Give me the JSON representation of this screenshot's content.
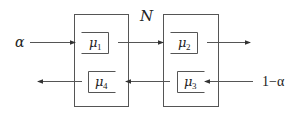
{
  "diagram": {
    "title_label": "N",
    "colors": {
      "stroke": "#555555",
      "text": "#222222",
      "background": "#ffffff"
    },
    "inputs": {
      "left": "α",
      "right": "1−α"
    },
    "nodes": [
      {
        "id": "node1",
        "queues": [
          {
            "id": "q1",
            "label": "μ",
            "subscript": "1",
            "direction": "right"
          },
          {
            "id": "q4",
            "label": "μ",
            "subscript": "4",
            "direction": "left"
          }
        ]
      },
      {
        "id": "node2",
        "queues": [
          {
            "id": "q2",
            "label": "μ",
            "subscript": "2",
            "direction": "right"
          },
          {
            "id": "q3",
            "label": "μ",
            "subscript": "3",
            "direction": "left"
          }
        ]
      }
    ]
  }
}
